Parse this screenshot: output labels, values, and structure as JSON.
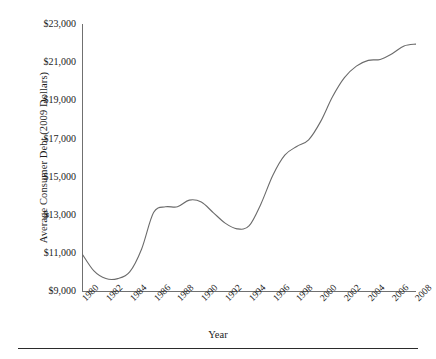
{
  "chart_data": {
    "type": "line",
    "title": "",
    "xlabel": "Year",
    "ylabel": "Average Consumer Debt (2009 Dollars)",
    "xlim": [
      1980,
      2008
    ],
    "ylim": [
      9000,
      23000
    ],
    "ytick_labels": [
      "$23,000",
      "$21,000",
      "$19,000",
      "$17,000",
      "$15,000",
      "$13,000",
      "$11,000",
      "$9,000"
    ],
    "ytick_values": [
      23000,
      21000,
      19000,
      17000,
      15000,
      13000,
      11000,
      9000
    ],
    "xtick_labels": [
      "1980",
      "1982",
      "1984",
      "1986",
      "1988",
      "1990",
      "1992",
      "1994",
      "1996",
      "1998",
      "2000",
      "2002",
      "2004",
      "2006",
      "2008"
    ],
    "xtick_values": [
      1980,
      1982,
      1984,
      1986,
      1988,
      1990,
      1992,
      1994,
      1996,
      1998,
      2000,
      2002,
      2004,
      2006,
      2008
    ],
    "grid": false,
    "legend": null,
    "line_color": "#6b6b6b",
    "series": [
      {
        "name": "Average Consumer Debt",
        "x": [
          1980,
          1981,
          1982,
          1983,
          1984,
          1985,
          1986,
          1987,
          1988,
          1989,
          1990,
          1991,
          1992,
          1993,
          1994,
          1995,
          1996,
          1997,
          1998,
          1999,
          2000,
          2001,
          2002,
          2003,
          2004,
          2005,
          2006,
          2007,
          2008
        ],
        "values": [
          11000,
          10100,
          9700,
          9700,
          10050,
          11250,
          13150,
          13450,
          13450,
          13800,
          13700,
          13150,
          12600,
          12300,
          12450,
          13600,
          15100,
          16150,
          16600,
          16950,
          17900,
          19200,
          20200,
          20800,
          21100,
          21150,
          21450,
          21850,
          21950
        ]
      }
    ]
  },
  "axes": {
    "y_title": "Average Consumer Debt (2009 Dollars)",
    "x_title": "Year"
  }
}
